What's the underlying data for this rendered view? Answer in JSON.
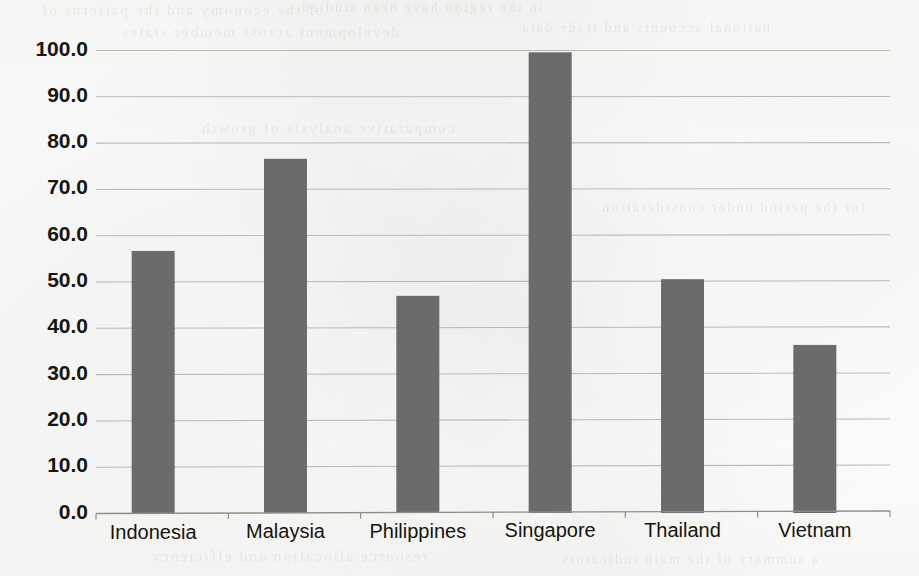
{
  "chart_data": {
    "type": "bar",
    "title": "",
    "subtitle": "",
    "xlabel": "",
    "ylabel": "",
    "categories": [
      "Indonesia",
      "Malaysia",
      "Philippines",
      "Singapore",
      "Thailand",
      "Vietnam"
    ],
    "values": [
      56.6,
      76.5,
      46.9,
      99.5,
      50.5,
      36.3
    ],
    "ylim": [
      0.0,
      100.0
    ],
    "ytick_values": [
      0.0,
      10.0,
      20.0,
      30.0,
      40.0,
      50.0,
      60.0,
      70.0,
      80.0,
      90.0,
      100.0
    ],
    "ytick_labels": [
      "0.0",
      "10.0",
      "20.0",
      "30.0",
      "40.0",
      "50.0",
      "60.0",
      "70.0",
      "80.0",
      "90.0",
      "100.0"
    ],
    "ytick_step": 10.0,
    "grid": {
      "horizontal": true,
      "vertical": false,
      "color": "#b9b9b4"
    },
    "legend": {
      "visible": false,
      "position": "none",
      "entries": []
    },
    "series": [
      {
        "name": "",
        "color": "#6b6b6b",
        "values": [
          56.6,
          76.5,
          46.9,
          99.5,
          50.5,
          36.3
        ]
      }
    ],
    "annotations": [],
    "data_labels_visible": false
  },
  "figure": {
    "background_color": "#fdfdfc",
    "bar_color": "#6b6b6b",
    "axis_color": "#8e8e88",
    "tick_label_color": "#16160f",
    "media": "scanned-page"
  },
  "bleed_through": {
    "description": "faint mirrored text showing through from the reverse side of the scanned page",
    "lines": [
      "of the economy and the patterns of",
      "in the region have been studied",
      "development across member states",
      "national accounts and trade data",
      "comparative analysis of growth",
      "for the period under consideration",
      "resource allocation and efficiency",
      "a summary of the main indicators"
    ]
  }
}
